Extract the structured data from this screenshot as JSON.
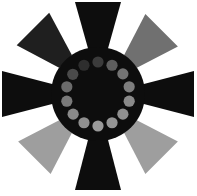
{
  "canvas": {
    "width": 197,
    "height": 196,
    "background_color": "#ffffff",
    "title": "Fan Impeller Graphic"
  },
  "chart_data": {
    "type": "pie",
    "title": "Fan Impeller Graphic",
    "subtitle": "",
    "xlabel": "",
    "ylabel": "",
    "legend_position": "none",
    "grid": false,
    "center": {
      "x": 98,
      "y": 94
    },
    "categories": [
      "blade-north",
      "blade-northeast",
      "blade-east",
      "blade-southeast",
      "blade-south",
      "blade-southwest",
      "blade-west",
      "blade-northwest"
    ],
    "values": [
      45,
      45,
      45,
      45,
      45,
      45,
      45,
      45
    ],
    "blade_angles_deg": [
      0,
      45,
      90,
      135,
      180,
      225,
      270,
      315
    ],
    "series": [
      {
        "name": "blade-fill-lightness",
        "values": [
          10,
          44,
          10,
          62,
          10,
          62,
          10,
          16
        ]
      }
    ]
  },
  "graphic": {
    "name": "fan-impeller",
    "hub": {
      "name": "hub-disc",
      "center_x": 98,
      "center_y": 94,
      "radius": 47,
      "fill": "#0d0d0d"
    },
    "dot_ring": {
      "name": "dot-ring",
      "count": 14,
      "ring_radius": 32,
      "dot_radius": 5.6,
      "start_angle_deg": -90,
      "dots": [
        {
          "index": 0,
          "angle_deg": -90,
          "fill": "#3b3b3b"
        },
        {
          "index": 1,
          "angle_deg": -64,
          "fill": "#5e5e5e"
        },
        {
          "index": 2,
          "angle_deg": -39,
          "fill": "#737373"
        },
        {
          "index": 3,
          "angle_deg": -13,
          "fill": "#7d7d7d"
        },
        {
          "index": 4,
          "angle_deg": 13,
          "fill": "#8a8a8a"
        },
        {
          "index": 5,
          "angle_deg": 39,
          "fill": "#8f8f8f"
        },
        {
          "index": 6,
          "angle_deg": 64,
          "fill": "#959595"
        },
        {
          "index": 7,
          "angle_deg": 90,
          "fill": "#9a9a9a"
        },
        {
          "index": 8,
          "angle_deg": 116,
          "fill": "#8f8f8f"
        },
        {
          "index": 9,
          "angle_deg": 141,
          "fill": "#8a8a8a"
        },
        {
          "index": 10,
          "angle_deg": 167,
          "fill": "#7a7a7a"
        },
        {
          "index": 11,
          "angle_deg": 193,
          "fill": "#6b6b6b"
        },
        {
          "index": 12,
          "angle_deg": 218,
          "fill": "#4a4a4a"
        },
        {
          "index": 13,
          "angle_deg": 244,
          "fill": "#2e2e2e"
        }
      ]
    },
    "blades": [
      {
        "name": "blade-north",
        "direction": "north",
        "angle_deg": -90,
        "fill": "#0d0d0d",
        "inner_radius": 42,
        "outer_radius": 92,
        "inner_half_width": 9,
        "outer_half_width": 23
      },
      {
        "name": "blade-northeast",
        "direction": "northeast",
        "angle_deg": -45,
        "fill": "#707070",
        "inner_radius": 46,
        "outer_radius": 90,
        "inner_half_width": 9,
        "outer_half_width": 23
      },
      {
        "name": "blade-east",
        "direction": "east",
        "angle_deg": 0,
        "fill": "#0d0d0d",
        "inner_radius": 42,
        "outer_radius": 96,
        "inner_half_width": 9,
        "outer_half_width": 23
      },
      {
        "name": "blade-southeast",
        "direction": "southeast",
        "angle_deg": 45,
        "fill": "#9e9e9e",
        "inner_radius": 46,
        "outer_radius": 90,
        "inner_half_width": 9,
        "outer_half_width": 23
      },
      {
        "name": "blade-south",
        "direction": "south",
        "angle_deg": 90,
        "fill": "#0d0d0d",
        "inner_radius": 42,
        "outer_radius": 96,
        "inner_half_width": 9,
        "outer_half_width": 23
      },
      {
        "name": "blade-southwest",
        "direction": "southwest",
        "angle_deg": 135,
        "fill": "#9e9e9e",
        "inner_radius": 46,
        "outer_radius": 90,
        "inner_half_width": 9,
        "outer_half_width": 23
      },
      {
        "name": "blade-west",
        "direction": "west",
        "angle_deg": 180,
        "fill": "#0d0d0d",
        "inner_radius": 42,
        "outer_radius": 96,
        "inner_half_width": 9,
        "outer_half_width": 23
      },
      {
        "name": "blade-northwest",
        "direction": "northwest",
        "angle_deg": 225,
        "fill": "#1f1f1f",
        "inner_radius": 46,
        "outer_radius": 92,
        "inner_half_width": 9,
        "outer_half_width": 23
      }
    ]
  }
}
